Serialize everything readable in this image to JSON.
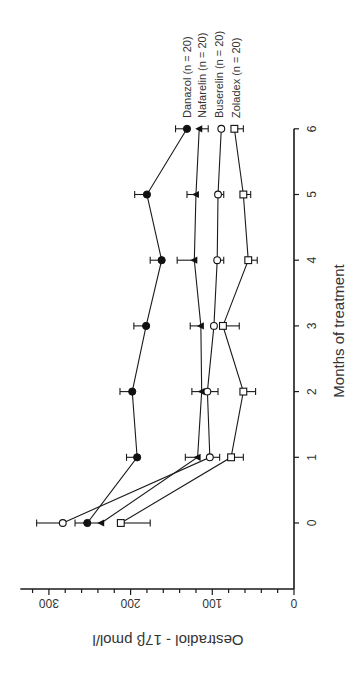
{
  "chart_data": {
    "type": "line",
    "title": "",
    "xlabel": "Months of treatment",
    "ylabel": "Oestradiol - 17β pmol/l",
    "x": [
      0,
      1,
      2,
      3,
      4,
      5,
      6
    ],
    "xticks": [
      "0",
      "1",
      "2",
      "3",
      "4",
      "5",
      "6"
    ],
    "yticks": [
      "0",
      "100",
      "200",
      "300"
    ],
    "ylim": [
      0,
      335
    ],
    "xlim": [
      -1,
      6
    ],
    "grid": false,
    "legend_position": "right, at end of lines",
    "orientation": "figure rotated 90 degrees counter-clockwise",
    "series": [
      {
        "name": "Danazol",
        "label": "Danazol   (n = 20)",
        "n": 20,
        "marker": "filled-circle",
        "values": [
          253,
          192,
          198,
          181,
          162,
          180,
          131
        ],
        "error": [
          15,
          13,
          15,
          15,
          14,
          15,
          14
        ]
      },
      {
        "name": "Nafarelin",
        "label": "Nafarelin  (n = 20)",
        "n": 20,
        "marker": "filled-triangle",
        "values": [
          236,
          118,
          113,
          114,
          122,
          120,
          116
        ],
        "error": [
          15,
          15,
          12,
          13,
          21,
          11,
          11
        ]
      },
      {
        "name": "Buserelin",
        "label": "Buserelin  (n = 20)",
        "n": 20,
        "marker": "open-circle",
        "values": [
          283,
          103,
          106,
          98,
          94,
          93,
          89
        ],
        "error": [
          32,
          12,
          13,
          0,
          8,
          7,
          0
        ]
      },
      {
        "name": "Zoladex",
        "label": "Zoladex    (n = 20)",
        "n": 20,
        "marker": "open-square",
        "values": [
          212,
          77,
          62,
          87,
          56,
          62,
          73
        ],
        "error": [
          36,
          15,
          15,
          20,
          11,
          9,
          11
        ]
      }
    ]
  }
}
